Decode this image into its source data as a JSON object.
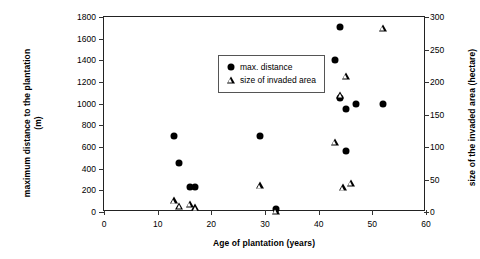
{
  "chart_data": {
    "type": "scatter",
    "title": "",
    "xlabel": "Age of plantation (years)",
    "ylabel": "maximum distance to the plantation\n(m)",
    "y2label": "size of the invaded area (hectare)",
    "xlim": [
      0,
      60
    ],
    "ylim": [
      0,
      1800
    ],
    "y2lim": [
      0,
      300
    ],
    "xticks": [
      0,
      10,
      20,
      30,
      40,
      50,
      60
    ],
    "yticks": [
      0,
      200,
      400,
      600,
      800,
      1000,
      1200,
      1400,
      1600,
      1800
    ],
    "y2ticks": [
      0,
      50,
      100,
      150,
      200,
      250,
      300
    ],
    "grid": false,
    "legend_position": "upper-left-inside",
    "series": [
      {
        "name": "max. distance",
        "marker": "circle",
        "axis": "left",
        "unit": "m",
        "points": [
          {
            "x": 13,
            "y": 700
          },
          {
            "x": 14,
            "y": 450
          },
          {
            "x": 16,
            "y": 230
          },
          {
            "x": 17,
            "y": 230
          },
          {
            "x": 29,
            "y": 700
          },
          {
            "x": 32,
            "y": 30
          },
          {
            "x": 43,
            "y": 1400
          },
          {
            "x": 44,
            "y": 1710
          },
          {
            "x": 44,
            "y": 1050
          },
          {
            "x": 45,
            "y": 950
          },
          {
            "x": 45,
            "y": 560
          },
          {
            "x": 47,
            "y": 1000
          },
          {
            "x": 52,
            "y": 1000
          }
        ]
      },
      {
        "name": "size of invaded area",
        "marker": "triangle",
        "axis": "right",
        "unit": "hectare",
        "points": [
          {
            "x": 13,
            "y": 18
          },
          {
            "x": 14,
            "y": 10
          },
          {
            "x": 16,
            "y": 12
          },
          {
            "x": 17,
            "y": 7
          },
          {
            "x": 29,
            "y": 41
          },
          {
            "x": 32,
            "y": 2
          },
          {
            "x": 43,
            "y": 108
          },
          {
            "x": 44,
            "y": 180
          },
          {
            "x": 44.5,
            "y": 38
          },
          {
            "x": 45,
            "y": 210
          },
          {
            "x": 46,
            "y": 45
          },
          {
            "x": 52,
            "y": 283
          }
        ]
      }
    ],
    "legend": [
      {
        "label": "max. distance",
        "marker": "circle"
      },
      {
        "label": "size of invaded area",
        "marker": "triangle"
      }
    ]
  },
  "colors": {
    "marker": "#000000",
    "axis": "#222222",
    "background": "#ffffff"
  }
}
